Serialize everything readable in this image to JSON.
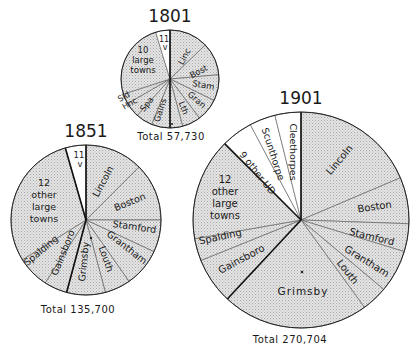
{
  "chart_data": [
    {
      "type": "pie",
      "title": "1801",
      "total_label": "Total 57,730",
      "total": 57730,
      "center": [
        170,
        79
      ],
      "radius": 49,
      "title_pos": [
        170,
        22
      ],
      "total_arc": {
        "start": 205,
        "end": 145
      },
      "slices": [
        {
          "label": "Linc",
          "start": 0,
          "end": 46,
          "fill": "shade"
        },
        {
          "label": "Bost",
          "start": 46,
          "end": 85,
          "fill": "shade"
        },
        {
          "label": "Stam",
          "start": 85,
          "end": 116,
          "fill": "shade"
        },
        {
          "label": "Gran",
          "start": 116,
          "end": 143,
          "fill": "shade"
        },
        {
          "label": "Lth",
          "start": 143,
          "end": 165,
          "fill": "shade"
        },
        {
          "label": "•",
          "start": 165,
          "end": 180,
          "fill": "shade"
        },
        {
          "label": "Gains",
          "start": 180,
          "end": 202,
          "fill": "shade"
        },
        {
          "label": "Spa",
          "start": 202,
          "end": 222,
          "fill": "shade"
        },
        {
          "label": "Hnc",
          "start": 222,
          "end": 240,
          "fill": "shade"
        },
        {
          "label": "Sld",
          "start": 240,
          "end": 252,
          "fill": "shade"
        },
        {
          "label": "10 large towns",
          "start": 252,
          "end": 343,
          "fill": "shade"
        },
        {
          "label": "11 v",
          "start": 343,
          "end": 360,
          "fill": "white"
        }
      ],
      "thick_lines": [
        0,
        180
      ]
    },
    {
      "type": "pie",
      "title": "1851",
      "total_label": "Total 135,700",
      "total": 135700,
      "center": [
        86,
        220
      ],
      "radius": 75,
      "title_pos": [
        86,
        137
      ],
      "slices": [
        {
          "label": "Lincoln",
          "start": 0,
          "end": 45,
          "fill": "shade"
        },
        {
          "label": "Boston",
          "start": 45,
          "end": 90,
          "fill": "shade"
        },
        {
          "label": "Stamford",
          "start": 90,
          "end": 115,
          "fill": "shade"
        },
        {
          "label": "Grantham",
          "start": 115,
          "end": 145,
          "fill": "shade"
        },
        {
          "label": "Louth",
          "start": 145,
          "end": 165,
          "fill": "shade"
        },
        {
          "label": "Grimsby",
          "start": 165,
          "end": 195,
          "fill": "shade"
        },
        {
          "label": "Gainsboro",
          "start": 195,
          "end": 213,
          "fill": "shade"
        },
        {
          "label": "Spalding",
          "start": 213,
          "end": 238,
          "fill": "shade"
        },
        {
          "label": "12 other large towns",
          "start": 238,
          "end": 344,
          "fill": "shade"
        },
        {
          "label": "11 v",
          "start": 344,
          "end": 360,
          "fill": "white"
        }
      ],
      "thick_lines": [
        0,
        195,
        344
      ]
    },
    {
      "type": "pie",
      "title": "1901",
      "total_label": "Total 270,704",
      "total": 270704,
      "center": [
        301,
        220
      ],
      "radius": 108,
      "title_pos": [
        301,
        104
      ],
      "slices": [
        {
          "label": "Lincoln",
          "start": 0,
          "end": 67,
          "fill": "shade"
        },
        {
          "label": "Boston",
          "start": 67,
          "end": 92,
          "fill": "shade"
        },
        {
          "label": "Stamford",
          "start": 92,
          "end": 107,
          "fill": "shade"
        },
        {
          "label": "Grantham",
          "start": 107,
          "end": 130,
          "fill": "shade"
        },
        {
          "label": "Louth",
          "start": 130,
          "end": 144,
          "fill": "shade"
        },
        {
          "label": "Grimsby",
          "start": 144,
          "end": 223,
          "fill": "shade"
        },
        {
          "label": "Gainsboro",
          "start": 223,
          "end": 248,
          "fill": "shade"
        },
        {
          "label": "Spalding",
          "start": 248,
          "end": 260,
          "fill": "shade"
        },
        {
          "label": "12 other large towns",
          "start": 260,
          "end": 315,
          "fill": "shade"
        },
        {
          "label": "9 other UD",
          "start": 315,
          "end": 332,
          "fill": "white"
        },
        {
          "label": "Scunthorpe",
          "start": 332,
          "end": 346,
          "fill": "white"
        },
        {
          "label": "Cleethorpes",
          "start": 346,
          "end": 360,
          "fill": "white"
        }
      ],
      "thick_lines": [
        0,
        223,
        315
      ]
    }
  ],
  "colors": {
    "shade": "#d9d9d9",
    "shade_light": "#e6e6e6",
    "white": "#ffffff",
    "stroke": "#2a2a2a"
  }
}
